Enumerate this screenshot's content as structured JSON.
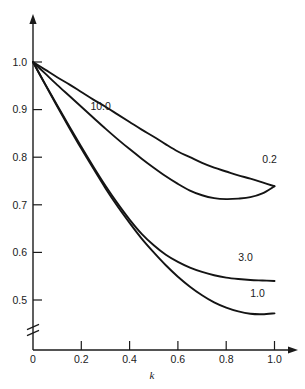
{
  "chart_data": {
    "type": "line",
    "title": "",
    "subtitle": "",
    "xlabel": "k",
    "ylabel": "",
    "xlim": [
      0,
      1.05
    ],
    "ylim": [
      0.45,
      1.02
    ],
    "grid": false,
    "legend_position": "inline-curve-labels",
    "axis_break": {
      "axis": "y",
      "below": 0.5,
      "symbol": "double-slash"
    },
    "x_ticks": [
      0,
      0.2,
      0.4,
      0.6,
      0.8,
      1.0
    ],
    "x_tick_labels": [
      "0",
      "0.2",
      "0.4",
      "0.6",
      "0.8",
      "1.0"
    ],
    "y_ticks": [
      0.5,
      0.6,
      0.7,
      0.8,
      0.9,
      1.0
    ],
    "y_tick_labels": [
      "0.5",
      "0.6",
      "0.7",
      "0.8",
      "0.9",
      "1.0"
    ],
    "series": [
      {
        "name": "0.2",
        "label": "0.2",
        "label_x": 0.98,
        "label_y": 0.787,
        "x": [
          0.0,
          0.05,
          0.1,
          0.15,
          0.2,
          0.25,
          0.3,
          0.35,
          0.4,
          0.45,
          0.5,
          0.55,
          0.6,
          0.65,
          0.7,
          0.75,
          0.8,
          0.85,
          0.9,
          0.95,
          1.0
        ],
        "values": [
          1.0,
          0.984,
          0.968,
          0.953,
          0.937,
          0.921,
          0.906,
          0.89,
          0.874,
          0.858,
          0.843,
          0.827,
          0.812,
          0.8,
          0.788,
          0.778,
          0.77,
          0.762,
          0.755,
          0.747,
          0.739
        ]
      },
      {
        "name": "10.0",
        "label": "10.0",
        "label_x": 0.28,
        "label_y": 0.9,
        "x": [
          0.0,
          0.05,
          0.1,
          0.15,
          0.2,
          0.25,
          0.3,
          0.35,
          0.4,
          0.45,
          0.5,
          0.55,
          0.6,
          0.65,
          0.7,
          0.75,
          0.8,
          0.85,
          0.9,
          0.95,
          1.0
        ],
        "values": [
          1.0,
          0.976,
          0.952,
          0.929,
          0.906,
          0.883,
          0.86,
          0.838,
          0.817,
          0.797,
          0.778,
          0.76,
          0.744,
          0.73,
          0.72,
          0.714,
          0.712,
          0.713,
          0.716,
          0.724,
          0.739
        ]
      },
      {
        "name": "3.0",
        "label": "3.0",
        "label_x": 0.88,
        "label_y": 0.582,
        "x": [
          0.0,
          0.05,
          0.1,
          0.15,
          0.2,
          0.25,
          0.3,
          0.35,
          0.4,
          0.45,
          0.5,
          0.55,
          0.6,
          0.65,
          0.7,
          0.75,
          0.8,
          0.85,
          0.9,
          0.95,
          1.0
        ],
        "values": [
          1.0,
          0.954,
          0.909,
          0.865,
          0.822,
          0.78,
          0.74,
          0.703,
          0.669,
          0.639,
          0.615,
          0.595,
          0.58,
          0.568,
          0.559,
          0.552,
          0.547,
          0.544,
          0.542,
          0.541,
          0.54
        ]
      },
      {
        "name": "1.0",
        "label": "1.0",
        "label_x": 0.93,
        "label_y": 0.506,
        "x": [
          0.0,
          0.05,
          0.1,
          0.15,
          0.2,
          0.25,
          0.3,
          0.35,
          0.4,
          0.45,
          0.5,
          0.55,
          0.6,
          0.65,
          0.7,
          0.75,
          0.8,
          0.85,
          0.9,
          0.95,
          1.0
        ],
        "values": [
          1.0,
          0.953,
          0.907,
          0.862,
          0.818,
          0.776,
          0.735,
          0.697,
          0.662,
          0.629,
          0.6,
          0.573,
          0.549,
          0.528,
          0.51,
          0.495,
          0.484,
          0.476,
          0.471,
          0.47,
          0.472
        ]
      }
    ]
  },
  "colors": {
    "axis": "#1a1a1a",
    "curve": "#141414",
    "background": "#ffffff"
  }
}
